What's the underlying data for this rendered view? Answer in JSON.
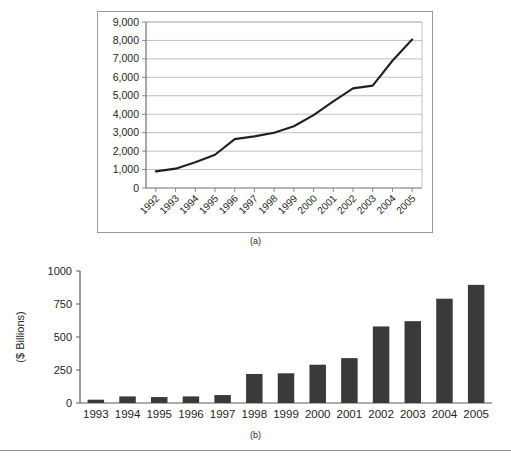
{
  "figure": {
    "caption_a": "(a)",
    "caption_b": "(b)"
  },
  "chart_data": [
    {
      "id": "chart-a",
      "type": "line",
      "title": "",
      "subtitle": "",
      "xlabel": "",
      "ylabel": "",
      "grid": true,
      "legend": "none",
      "xlim": [
        "1992",
        "2005"
      ],
      "ylim": [
        0,
        9000
      ],
      "ytick_labels": [
        "9,000",
        "8,000",
        "7,000",
        "6,000",
        "5,000",
        "4,000",
        "3,000",
        "2,000",
        "1,000",
        "0"
      ],
      "yticks": [
        9000,
        8000,
        7000,
        6000,
        5000,
        4000,
        3000,
        2000,
        1000,
        0
      ],
      "categories": [
        "1992",
        "1993",
        "1994",
        "1995",
        "1996",
        "1997",
        "1998",
        "1999",
        "2000",
        "2001",
        "2002",
        "2003",
        "2004",
        "2005"
      ],
      "values": [
        900,
        1050,
        1400,
        1800,
        2650,
        2800,
        3000,
        3350,
        3950,
        4700,
        5400,
        5550,
        6900,
        8050
      ],
      "series": [
        {
          "name": "series-1",
          "values": [
            900,
            1050,
            1400,
            1800,
            2650,
            2800,
            3000,
            3350,
            3950,
            4700,
            5400,
            5550,
            6900,
            8050
          ]
        }
      ],
      "tick_label_rotation": -45,
      "line_color": "#231f20"
    },
    {
      "id": "chart-b",
      "type": "bar",
      "title": "",
      "subtitle": "",
      "xlabel": "",
      "ylabel": "($ Billions)",
      "grid": false,
      "legend": "none",
      "ylim": [
        0,
        1000
      ],
      "ytick_labels": [
        "1000",
        "750",
        "500",
        "250",
        "0"
      ],
      "yticks": [
        1000,
        750,
        500,
        250,
        0
      ],
      "categories": [
        "1993",
        "1994",
        "1995",
        "1996",
        "1997",
        "1998",
        "1999",
        "2000",
        "2001",
        "2002",
        "2003",
        "2004",
        "2005"
      ],
      "values": [
        25,
        50,
        45,
        50,
        60,
        220,
        225,
        290,
        340,
        580,
        620,
        790,
        895
      ],
      "series": [
        {
          "name": "series-1",
          "values": [
            25,
            50,
            45,
            50,
            60,
            220,
            225,
            290,
            340,
            580,
            620,
            790,
            895
          ]
        }
      ],
      "bar_color": "#3a3a3a"
    }
  ]
}
